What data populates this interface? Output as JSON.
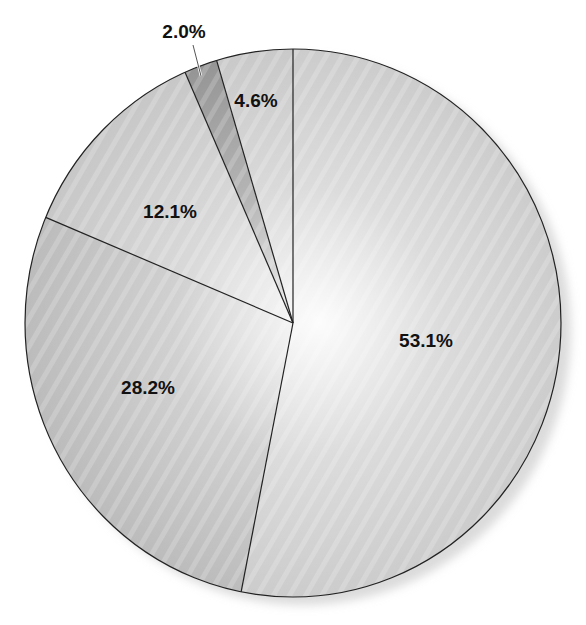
{
  "chart_data": {
    "type": "pie",
    "title": "",
    "start_angle_deg": 0,
    "direction": "clockwise",
    "slices": [
      {
        "label": "53.1%",
        "value": 53.1,
        "color": "#c9c9c9",
        "label_pos": [
          426,
          342
        ]
      },
      {
        "label": "28.2%",
        "value": 28.2,
        "color": "#b8b8b8",
        "label_pos": [
          148,
          389
        ]
      },
      {
        "label": "12.1%",
        "value": 12.1,
        "color": "#c4c4c4",
        "label_pos": [
          170,
          213
        ]
      },
      {
        "label": "2.0%",
        "value": 2.0,
        "color": "#8f8f8f",
        "label_pos": [
          184,
          33
        ],
        "leader_line": [
          [
            193,
            45
          ],
          [
            201,
            76
          ]
        ]
      },
      {
        "label": "4.6%",
        "value": 4.6,
        "color": "#c6c6c6",
        "label_pos": [
          256,
          102
        ]
      }
    ],
    "categories": [
      "53.1%",
      "28.2%",
      "12.1%",
      "2.0%",
      "4.6%"
    ],
    "values": [
      53.1,
      28.2,
      12.1,
      2.0,
      4.6
    ],
    "legend": null
  },
  "geometry": {
    "cx": 293,
    "cy": 323,
    "rx": 268,
    "ry": 274
  }
}
